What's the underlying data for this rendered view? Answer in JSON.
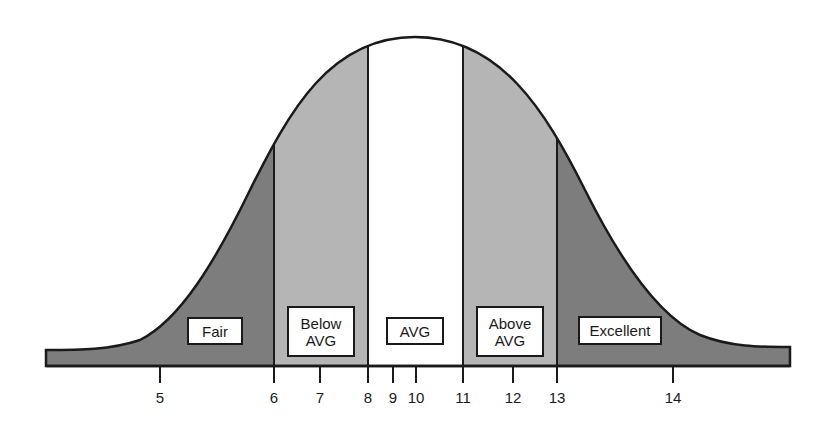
{
  "diagram": {
    "type": "bell-curve-rating-scale",
    "colors": {
      "outer_zone": "#7d7d7d",
      "middle_zone": "#b5b5b5",
      "center_zone": "#ffffff",
      "outline": "#1a1a1a"
    },
    "zones": [
      {
        "id": "fair",
        "label": "Fair",
        "range": [
          "<",
          "6"
        ],
        "box": {
          "x": 187,
          "y": 317,
          "w": 56,
          "h": 28
        }
      },
      {
        "id": "below-avg",
        "label": "Below\nAVG",
        "range": [
          "6",
          "8"
        ],
        "box": {
          "x": 287,
          "y": 306,
          "w": 68,
          "h": 51
        }
      },
      {
        "id": "avg",
        "label": "AVG",
        "range": [
          "8",
          "11"
        ],
        "box": {
          "x": 386,
          "y": 317,
          "w": 58,
          "h": 28
        }
      },
      {
        "id": "above-avg",
        "label": "Above\nAVG",
        "range": [
          "11",
          "13"
        ],
        "box": {
          "x": 476,
          "y": 306,
          "w": 68,
          "h": 51
        }
      },
      {
        "id": "excellent",
        "label": "Excellent",
        "range": [
          "13",
          ">"
        ],
        "box": {
          "x": 578,
          "y": 316,
          "w": 84,
          "h": 29
        }
      }
    ],
    "axis": {
      "ticks": [
        {
          "label": "5",
          "x": 160
        },
        {
          "label": "6",
          "x": 274
        },
        {
          "label": "7",
          "x": 320
        },
        {
          "label": "8",
          "x": 368
        },
        {
          "label": "9",
          "x": 393
        },
        {
          "label": "10",
          "x": 416
        },
        {
          "label": "11",
          "x": 463
        },
        {
          "label": "12",
          "x": 513
        },
        {
          "label": "13",
          "x": 557
        },
        {
          "label": "14",
          "x": 673
        }
      ]
    }
  }
}
